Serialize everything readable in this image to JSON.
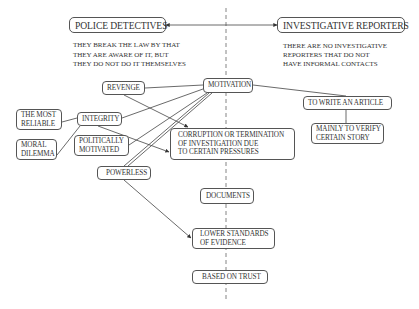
{
  "diagram": {
    "headers": {
      "left": "POLICE DETECTIVES",
      "right": "INVESTIGATIVE REPORTERS"
    },
    "notes": {
      "left": [
        "THEY BREAK THE LAW BY THAT",
        "THEY ARE AWARE OF IT, BUT",
        "THEY DO NOT DO IT THEMSELVES"
      ],
      "right": [
        "THERE ARE NO INVESTIGATIVE",
        "REPORTERS THAT DO NOT",
        "HAVE INFORMAL CONTACTS"
      ]
    },
    "nodes": {
      "revenge": [
        "REVENGE"
      ],
      "motivation": [
        "MOTIVATION"
      ],
      "to_write_article": [
        "TO WRITE AN ARTICLE"
      ],
      "mainly_verify": [
        "MAINLY TO VERIFY",
        "CERTAIN STORY"
      ],
      "most_reliable": [
        "THE MOST",
        "RELIABLE"
      ],
      "integrity": [
        "INTEGRITY"
      ],
      "moral_dilemma": [
        "MORAL",
        "DILEMMA"
      ],
      "politically_motivated": [
        "POLITICALLY",
        "MOTIVATED"
      ],
      "corruption": [
        "CORRUPTION OR TERMINATION",
        "OF INVESTIGATION DUE",
        "TO CERTAIN PRESSURES"
      ],
      "powerless": [
        "POWERLESS"
      ],
      "documents": [
        "DOCUMENTS"
      ],
      "lower_standards": [
        "LOWER STANDARDS",
        "OF EVIDENCE"
      ],
      "based_on_trust": [
        "BASED ON TRUST"
      ]
    },
    "edges": [
      {
        "from": "police_detectives",
        "to": "investigative_reporters",
        "type": "bidirectional-arrow"
      },
      {
        "from": "revenge",
        "to": "motivation",
        "type": "line"
      },
      {
        "from": "revenge",
        "to": "corruption",
        "type": "arrow"
      },
      {
        "from": "motivation",
        "to": "to_write_article",
        "type": "line"
      },
      {
        "from": "to_write_article",
        "to": "mainly_verify",
        "type": "line"
      },
      {
        "from": "integrity",
        "to": "motivation",
        "type": "line"
      },
      {
        "from": "integrity",
        "to": "most_reliable",
        "type": "line"
      },
      {
        "from": "integrity",
        "to": "moral_dilemma",
        "type": "line"
      },
      {
        "from": "integrity",
        "to": "corruption",
        "type": "arrow"
      },
      {
        "from": "politically_motivated",
        "to": "motivation",
        "type": "line"
      },
      {
        "from": "powerless",
        "to": "motivation",
        "type": "line"
      },
      {
        "from": "powerless",
        "to": "lower_standards",
        "type": "arrow"
      }
    ],
    "divider": {
      "style": "dashed",
      "color": "#777777"
    },
    "colors": {
      "line": "#444444",
      "border": "#555555",
      "text": "#333333",
      "background": "#ffffff"
    }
  }
}
